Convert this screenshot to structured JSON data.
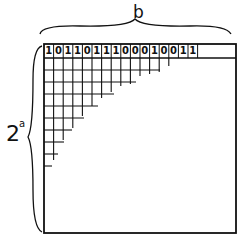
{
  "diagram": {
    "top_label": "b",
    "side_label_base": "2",
    "side_label_exponent": "a",
    "bits": [
      "1",
      "0",
      "1",
      "1",
      "0",
      "1",
      "1",
      "1",
      "0",
      "0",
      "0",
      "1",
      "0",
      "0",
      "1",
      "1"
    ],
    "colors": {
      "ink": "#111111",
      "background": "#ffffff"
    }
  }
}
